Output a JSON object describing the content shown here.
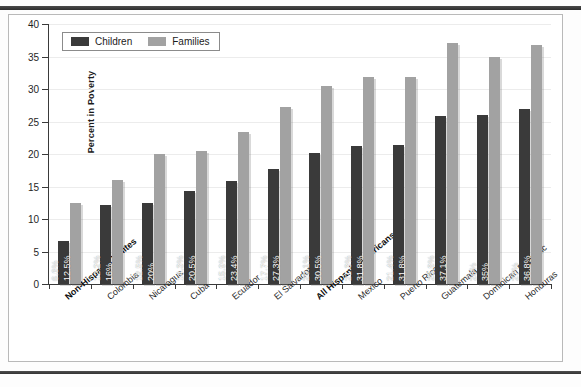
{
  "chart_data": {
    "type": "bar",
    "title": "",
    "xlabel": "",
    "ylabel": "Percent in Poverty",
    "ylim": [
      0,
      40
    ],
    "ytick_values": [
      0,
      5,
      10,
      15,
      20,
      25,
      30,
      35,
      40
    ],
    "ytick_labels": [
      "0",
      "5",
      "10",
      "15",
      "20",
      "25",
      "30",
      "35",
      "40"
    ],
    "grid": true,
    "legend_position": "top-left",
    "categories": [
      "Non-Hispanic Whites",
      "Colombia",
      "Nicaragua",
      "Cuba",
      "Ecuador",
      "El Salvador",
      "All Hispanic Americans",
      "Mexico",
      "Puerto Rico",
      "Guatemala",
      "Dominican Republic",
      "Honduras"
    ],
    "categories_bold": [
      "Non-Hispanic Whites",
      "All Hispanic Americans"
    ],
    "series": [
      {
        "name": "Children",
        "color": "#3a3a3a",
        "values": [
          6.6,
          12.2,
          12.5,
          14.3,
          15.9,
          17.7,
          20.1,
          21.3,
          21.4,
          25.8,
          26,
          27
        ],
        "labels": [
          "6.6%",
          "12.2%",
          "12.5%",
          "14.3%",
          "15.9%",
          "17.7%",
          "20.1%",
          "21.3%",
          "21.4%",
          "25.8%",
          "26%",
          "27%"
        ]
      },
      {
        "name": "Families",
        "color": "#a2a2a2",
        "values": [
          12.5,
          16,
          20,
          20.5,
          23.4,
          27.3,
          30.5,
          31.8,
          31.8,
          37.1,
          35,
          36.8
        ],
        "labels": [
          "12.5%",
          "16%",
          "20%",
          "20.5%",
          "23.4%",
          "27.3%",
          "30.5%",
          "31.8%",
          "31.8%",
          "37.1%",
          "35%",
          "36.8%"
        ]
      }
    ]
  },
  "legend": {
    "items": [
      {
        "label": "Children",
        "color": "#3a3a3a"
      },
      {
        "label": "Families",
        "color": "#a2a2a2"
      }
    ]
  },
  "axis": {
    "y_title": "Percent in Poverty"
  }
}
